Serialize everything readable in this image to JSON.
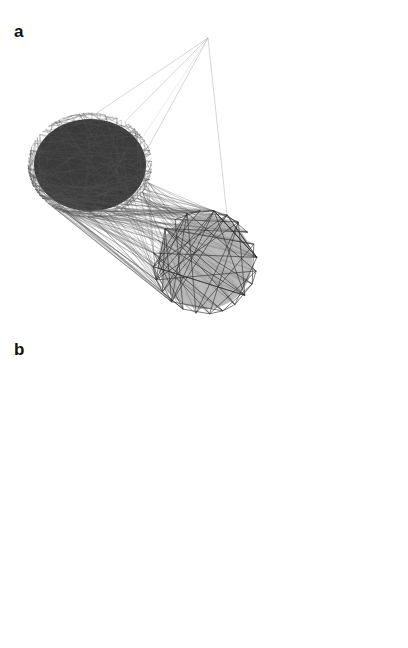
{
  "figure": {
    "panels": [
      {
        "letter": "a",
        "hub_nodes": [
          {
            "id": "TMOD1",
            "label": "TMOD1",
            "x": 208,
            "y": 38
          },
          {
            "id": "OPRL1",
            "label": "OPRL1",
            "x": 207,
            "y": 126
          },
          {
            "id": "CRHBP",
            "label": "CRHBP",
            "x": 322,
            "y": 126
          },
          {
            "id": "TCEAL",
            "label": "TCEAL",
            "x": 270,
            "y": 157
          },
          {
            "id": "PNHA3",
            "label": "PNHA3",
            "x": 382,
            "y": 157
          },
          {
            "id": "DEFB114",
            "label": "DEFB114",
            "x": 290,
            "y": 207
          },
          {
            "id": "SCGB1D1",
            "label": "SCGB1D1",
            "x": 358,
            "y": 207
          }
        ]
      },
      {
        "letter": "b",
        "hub_nodes": [
          {
            "id": "TMOD1",
            "label": "TMOD1",
            "x": 208,
            "y": 30
          },
          {
            "id": "OPRL1",
            "label": "OPRL1",
            "x": 207,
            "y": 120
          },
          {
            "id": "CRHBP",
            "label": "CRHBP",
            "x": 322,
            "y": 120
          },
          {
            "id": "TCEAL8",
            "label": "TCEAL8",
            "x": 268,
            "y": 150
          },
          {
            "id": "PNHA3",
            "label": "PNHA3",
            "x": 382,
            "y": 150
          },
          {
            "id": "DEFB114",
            "label": "DEFB114",
            "x": 290,
            "y": 200
          },
          {
            "id": "SCGB1D1",
            "label": "SCGB1D1",
            "x": 358,
            "y": 200
          }
        ]
      }
    ],
    "small_cluster_labels": [
      "DMD",
      "ABCB",
      "APOE",
      "KLHL4",
      "SERGL",
      "PTPRN",
      "CNIP2",
      "ANSL15B",
      "ALDH1A2",
      "GFAP",
      "PPARG",
      "HCG31",
      "BNCA",
      "CABP",
      "EPLI",
      "NPR1",
      "NCNE",
      "F2R",
      "CAR2",
      "DH1A",
      "NRIC",
      "ADH1A",
      "MME",
      "MAP1LC3"
    ],
    "big_cluster_note": "dense ring of overlapping node labels"
  },
  "colors": {
    "node_fill": "#c8c8c8",
    "node_stroke": "#b5b5b5",
    "edge_dark": "#333333",
    "edge_mid": "#777777",
    "edge_light": "#bdbdbd"
  }
}
